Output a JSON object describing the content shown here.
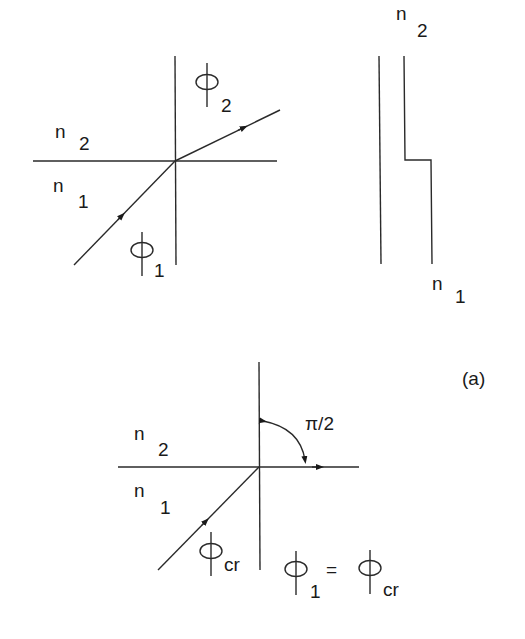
{
  "figure": {
    "panel_label": "(a)",
    "refraction_diagram": {
      "medium_top": {
        "symbol": "n",
        "subscript": "2"
      },
      "medium_bottom": {
        "symbol": "n",
        "subscript": "1"
      },
      "incident_angle": {
        "symbol": "φ",
        "subscript": "1"
      },
      "refracted_angle": {
        "symbol": "φ",
        "subscript": "2"
      }
    },
    "index_profile": {
      "top_label": {
        "symbol": "n",
        "subscript": "2"
      },
      "bottom_label": {
        "symbol": "n",
        "subscript": "1"
      }
    },
    "critical_angle_diagram": {
      "medium_top": {
        "symbol": "n",
        "subscript": "2"
      },
      "medium_bottom": {
        "symbol": "n",
        "subscript": "1"
      },
      "incident_angle": {
        "symbol": "φ",
        "subscript": "cr"
      },
      "refracted_angle_label": "π/2",
      "equation": {
        "lhs_symbol": "φ",
        "lhs_subscript": "1",
        "equals": "=",
        "rhs_symbol": "φ",
        "rhs_subscript": "cr"
      }
    }
  }
}
